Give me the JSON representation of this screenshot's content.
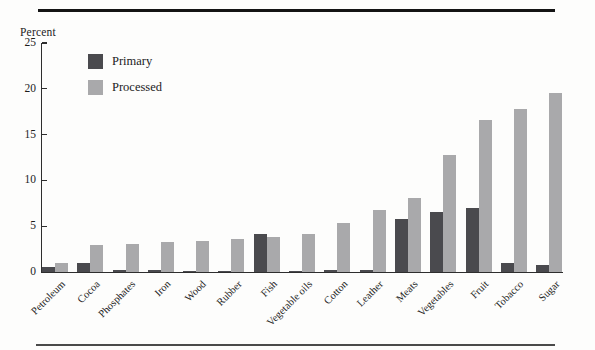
{
  "chart_data": {
    "type": "bar",
    "title": "",
    "ylabel": "Percent",
    "xlabel": "",
    "categories": [
      "Petroleum",
      "Cocoa",
      "Phosphates",
      "Iron",
      "Wood",
      "Rubber",
      "Fish",
      "Vegetable oils",
      "Cotton",
      "Leather",
      "Meats",
      "Vegetables",
      "Fruit",
      "Tobacco",
      "Sugar"
    ],
    "series": [
      {
        "name": "Primary",
        "color": "#4a4a4e",
        "values": [
          0.5,
          1.0,
          0.2,
          0.2,
          0.1,
          0.1,
          4.1,
          0.1,
          0.2,
          0.2,
          5.8,
          6.6,
          7.0,
          1.0,
          0.8
        ]
      },
      {
        "name": "Processed",
        "color": "#a9a9ab",
        "values": [
          1.0,
          2.9,
          3.1,
          3.3,
          3.4,
          3.6,
          3.8,
          4.2,
          5.4,
          6.8,
          8.1,
          12.8,
          16.6,
          17.8,
          19.5
        ]
      }
    ],
    "ylim": [
      0,
      25
    ],
    "yticks": [
      0,
      5,
      10,
      15,
      20,
      25
    ],
    "grid": false,
    "legend_position": "upper-left-inside",
    "axis_color": "#2e2e2e",
    "background_color": "#fdfdfc"
  }
}
